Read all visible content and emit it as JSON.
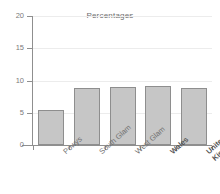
{
  "chart_data": {
    "type": "bar",
    "title": "Percentages",
    "xlabel": "",
    "ylabel": "",
    "categories": [
      "Powys",
      "South Glam",
      "West Glam",
      "Wales",
      "United\nKingdom"
    ],
    "values": [
      5.5,
      8.8,
      9.0,
      9.2,
      8.9
    ],
    "ylim": [
      0,
      20
    ],
    "yticks": [
      0,
      5,
      10,
      15,
      20
    ],
    "ytick_labels": [
      "0",
      "5",
      "10",
      "15",
      "20"
    ],
    "grid": true,
    "legend": null,
    "emphasis": [
      "Wales",
      "United\nKingdom"
    ],
    "bar_fill": "#c6c6c6",
    "bar_border": "#8e8e8e",
    "grid_color": "#ececec",
    "axis_color": "#8f8f8f",
    "text_color": "#6f6f6f",
    "background": "#ffffff"
  }
}
